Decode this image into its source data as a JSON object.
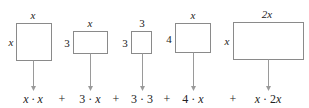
{
  "diagram": {
    "rectangles": [
      {
        "id": "r1",
        "top_label": "x",
        "side_label": "x",
        "product": "x · x"
      },
      {
        "id": "r2",
        "top_label": "x",
        "side_label": "3",
        "product": "3 · x"
      },
      {
        "id": "r3",
        "top_label": "3",
        "side_label": "3",
        "product": "3 · 3"
      },
      {
        "id": "r4",
        "top_label": "x",
        "side_label": "4",
        "product": "4 · x"
      },
      {
        "id": "r5",
        "top_label": "2x",
        "side_label": "x",
        "product": "x · 2x"
      }
    ],
    "operators": [
      "+",
      "+",
      "+",
      "+"
    ],
    "colors": {
      "box_stroke": "#8a8a8a",
      "arrow": "#9a9a9a",
      "text": "#222222"
    }
  }
}
